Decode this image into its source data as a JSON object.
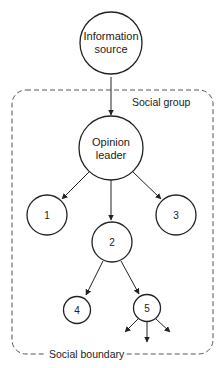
{
  "diagram": {
    "nodes": {
      "source": {
        "line1": "Information",
        "line2": "source"
      },
      "leader": {
        "line1": "Opinion",
        "line2": "leader"
      },
      "n1": {
        "label": "1"
      },
      "n2": {
        "label": "2"
      },
      "n3": {
        "label": "3"
      },
      "n4": {
        "label": "4"
      },
      "n5": {
        "label": "5"
      }
    },
    "group_label": "Social group",
    "boundary_label": "Social boundary",
    "edges": [
      [
        "Information source",
        "Opinion leader"
      ],
      [
        "Opinion leader",
        "1"
      ],
      [
        "Opinion leader",
        "2"
      ],
      [
        "Opinion leader",
        "3"
      ],
      [
        "2",
        "4"
      ],
      [
        "2",
        "5"
      ],
      [
        "5",
        "outward (3 arrows)"
      ]
    ],
    "colors": {
      "stroke": "#222222",
      "dashed": "#555555",
      "background": "#ffffff"
    }
  }
}
